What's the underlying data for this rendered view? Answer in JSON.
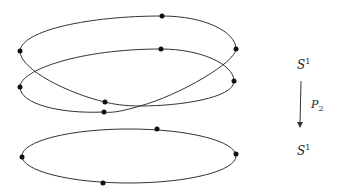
{
  "diagram": {
    "top_space": {
      "base": "S",
      "sup": "1"
    },
    "bottom_space": {
      "base": "S",
      "sup": "1"
    },
    "map": {
      "base": "P",
      "sub": "2"
    },
    "stroke_color": "#333333",
    "point_color": "#111111"
  }
}
